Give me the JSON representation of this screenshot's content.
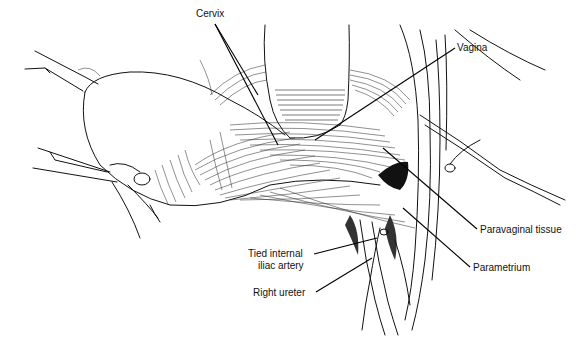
{
  "figure": {
    "type": "anatomical line illustration",
    "background": "#ffffff",
    "ink_color": "#111111"
  },
  "labels": [
    {
      "id": "cervix",
      "text": "Cervix",
      "x": 196,
      "y": 15,
      "align": "left",
      "anchor": [
        268,
        146
      ]
    },
    {
      "id": "vagina",
      "text": "Vagina",
      "x": 457,
      "y": 44,
      "align": "left",
      "anchor": [
        315,
        140
      ]
    },
    {
      "id": "paravaginal",
      "text": "Paravaginal tissue",
      "x": 480,
      "y": 226,
      "align": "left",
      "anchor": [
        383,
        147
      ]
    },
    {
      "id": "parametrium",
      "text": "Parametrium",
      "x": 473,
      "y": 264,
      "align": "left",
      "anchor": [
        403,
        207
      ]
    },
    {
      "id": "tied-artery-1",
      "text": "Tied internal",
      "x": 248,
      "y": 250,
      "align": "right",
      "anchor": [
        377,
        238
      ]
    },
    {
      "id": "tied-artery-2",
      "text": "iliac artery",
      "x": 258,
      "y": 262,
      "align": "right",
      "anchor": null
    },
    {
      "id": "right-ureter",
      "text": "Right ureter",
      "x": 253,
      "y": 289,
      "align": "right",
      "anchor": [
        372,
        258
      ]
    }
  ]
}
